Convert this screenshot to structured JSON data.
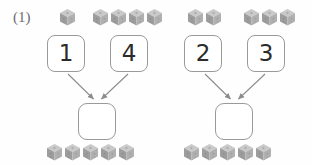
{
  "worksheet": {
    "problem_label": "(1)",
    "background_color": "#fefefe",
    "box_border_color": "#9a9a9a",
    "digit_color": "#2b2b2b",
    "cube_top_color": "#c9c9c9",
    "cube_left_color": "#9d9d9d",
    "cube_right_color": "#b0b0b0",
    "arrow_color": "#8c8c8c"
  },
  "problems": [
    {
      "id": "left",
      "addend_a": "1",
      "addend_b": "4",
      "sum": "",
      "cubes_top_group_a": 1,
      "cubes_top_group_b": 4,
      "cubes_bottom": 5
    },
    {
      "id": "right",
      "addend_a": "2",
      "addend_b": "3",
      "sum": "",
      "cubes_top_group_a": 2,
      "cubes_top_group_b": 3,
      "cubes_bottom": 5
    }
  ],
  "cube_positions": {
    "top_left_group_a": [
      [
        59,
        8
      ]
    ],
    "top_left_group_b": [
      [
        92,
        8
      ],
      [
        110,
        8
      ],
      [
        128,
        8
      ],
      [
        146,
        8
      ]
    ],
    "top_right_group_a": [
      [
        187,
        8
      ],
      [
        205,
        8
      ]
    ],
    "top_right_group_b": [
      [
        243,
        8
      ],
      [
        261,
        8
      ],
      [
        279,
        8
      ]
    ],
    "bottom_left": [
      [
        46,
        143
      ],
      [
        64,
        143
      ],
      [
        82,
        143
      ],
      [
        100,
        143
      ],
      [
        118,
        143
      ]
    ],
    "bottom_right": [
      [
        183,
        143
      ],
      [
        201,
        143
      ],
      [
        219,
        143
      ],
      [
        237,
        143
      ],
      [
        255,
        143
      ]
    ]
  },
  "box_positions": {
    "left_addend_a": [
      47,
      35
    ],
    "left_addend_b": [
      110,
      35
    ],
    "left_sum": [
      78,
      103
    ],
    "right_addend_a": [
      184,
      35
    ],
    "right_addend_b": [
      247,
      35
    ],
    "right_sum": [
      215,
      103
    ]
  }
}
